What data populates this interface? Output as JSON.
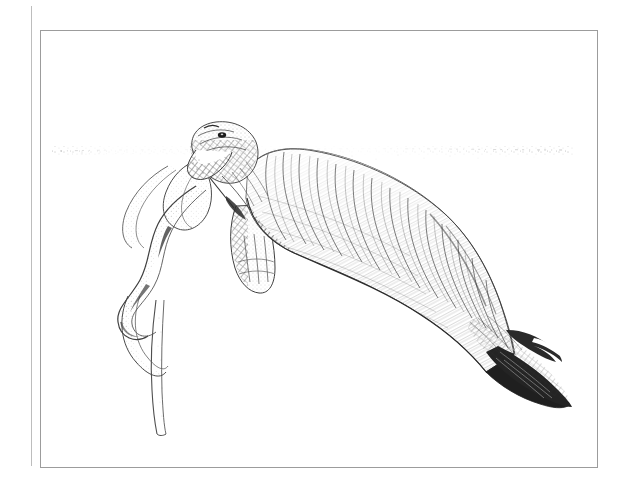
{
  "canvas": {
    "width": 629,
    "height": 495,
    "background_color": "#ffffff",
    "medium": "pen-and-ink stipple and cross-hatch line drawing",
    "title": ""
  },
  "frame": {
    "outer_rule": {
      "name": "outer-vertical-rule",
      "orientation": "vertical",
      "x": 31,
      "y_top": 6,
      "y_bottom": 466,
      "color": "#b9b9b9",
      "stroke_width": 1
    },
    "inner_border": {
      "name": "inner-plate-border",
      "x": 40,
      "y": 30,
      "width": 557,
      "height": 437,
      "color": "#9a9a9a",
      "stroke_width": 1,
      "fill": "#ffffff"
    }
  },
  "scene": {
    "subject": "dugong",
    "subject_common_name": "Dugong / manatee",
    "pose": "head up near water surface, body angled down to lower right, tail fluke at lower right",
    "ink_color": "#2b2b2b",
    "light_ink_color": "#6d6d6d",
    "waterline": {
      "name": "water-surface-line",
      "description": "broken stipple line marking the surface of the water",
      "y": 150,
      "x_start": 58,
      "x_end": 570,
      "style": "dotted / stippled, fading at both ends"
    },
    "elements": [
      {
        "name": "dugong-head",
        "label": "Head and snout",
        "x": 186,
        "y": 124,
        "width": 72,
        "height": 58
      },
      {
        "name": "dugong-body",
        "label": "Barrel body with wrinkled hide",
        "x": 238,
        "y": 150,
        "width": 260,
        "height": 190
      },
      {
        "name": "dugong-flipper",
        "label": "Pectoral flipper",
        "x": 228,
        "y": 205,
        "width": 48,
        "height": 88
      },
      {
        "name": "dugong-tail-fluke",
        "label": "Tail fluke",
        "x": 470,
        "y": 316,
        "width": 100,
        "height": 86
      },
      {
        "name": "seagrass-ribbon-upper",
        "label": "Upper seagrass ribbon blade",
        "x": 148,
        "y": 158,
        "width": 80,
        "height": 80
      },
      {
        "name": "seagrass-ribbon-twist",
        "label": "Twisting seagrass ribbon",
        "x": 112,
        "y": 212,
        "width": 96,
        "height": 120
      },
      {
        "name": "seagrass-stipe",
        "label": "Long seagrass stipe",
        "x": 140,
        "y": 300,
        "width": 30,
        "height": 130
      }
    ]
  }
}
